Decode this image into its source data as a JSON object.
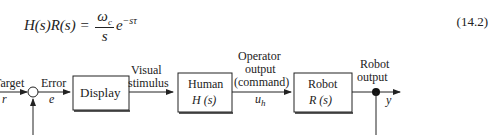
{
  "equation": {
    "lhs": "H(s)R(s) =",
    "numerator": "ω",
    "numerator_sub": "c",
    "denominator": "s",
    "exp_base": "e",
    "exp_power": "−sτ",
    "number": "(14.2)"
  },
  "diagram": {
    "input_label_1": "Target",
    "input_label_2": "r",
    "error_label_1": "Error",
    "error_label_2": "e",
    "display_block": "Display",
    "visual_label_1": "Visual",
    "visual_label_2": "stimulus",
    "human_block_1": "Human",
    "human_block_2": "H (s)",
    "operator_label_1": "Operator",
    "operator_label_2": "output",
    "operator_label_3": "(command)",
    "operator_label_4": "u",
    "operator_label_4_sub": "h",
    "robot_block_1": "Robot",
    "robot_block_2": "R (s)",
    "robot_out_label_1": "Robot",
    "robot_out_label_2": "output",
    "output_label": "y"
  }
}
